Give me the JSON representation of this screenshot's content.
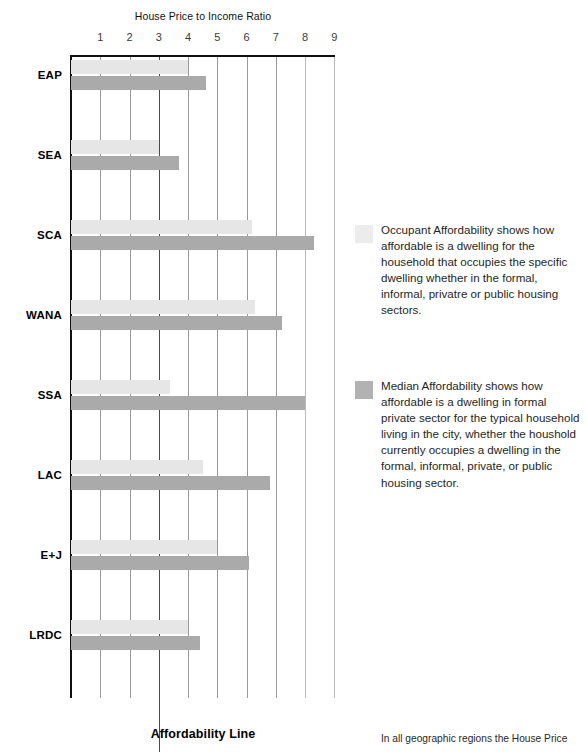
{
  "chart_data": {
    "type": "bar",
    "orientation": "horizontal",
    "title": "House Price to Income Ratio",
    "xlabel": "House Price to Income Ratio",
    "ylabel": "",
    "xlim": [
      0,
      9.6
    ],
    "xticks": [
      1,
      2,
      3,
      4,
      5,
      6,
      7,
      8,
      9
    ],
    "grid": true,
    "legend_position": "right",
    "categories": [
      "EAP",
      "SEA",
      "SCA",
      "WANA",
      "SSA",
      "LAC",
      "E+J",
      "LRDC"
    ],
    "series": [
      {
        "name": "Occupant Affordability",
        "color": "#e6e6e6",
        "values": [
          4.0,
          3.0,
          6.2,
          6.3,
          3.4,
          4.5,
          5.0,
          4.0
        ]
      },
      {
        "name": "Median Affordability",
        "color": "#aaaaaa",
        "values": [
          4.6,
          3.7,
          8.3,
          7.2,
          8.0,
          6.8,
          6.1,
          4.4
        ]
      }
    ],
    "annotations": [
      {
        "name": "affordability-line",
        "value": 3,
        "label": "Affordability Line",
        "color": "#4a4a4a"
      }
    ]
  },
  "axis": {
    "title": "House Price to Income Ratio",
    "ticks": [
      "1",
      "2",
      "3",
      "4",
      "5",
      "6",
      "7",
      "8",
      "9"
    ]
  },
  "categories": [
    "EAP",
    "SEA",
    "SCA",
    "WANA",
    "SSA",
    "LAC",
    "E+J",
    "LRDC"
  ],
  "affordability_line_label": "Affordability Line",
  "legend": {
    "items": [
      {
        "swatch": "occupant",
        "text": "Occupant Affordability shows how affordable is a dwelling for the household that occupies the specific dwelling whether in the formal, informal, privatre or public housing sectors."
      },
      {
        "swatch": "median",
        "text": "Median Affordability shows how affordable is a dwelling in formal private sector for the typical household living in the city, whether the houshold currently occupies a dwelling in the formal, informal, private, or public housing sector."
      }
    ]
  },
  "body_note": "In all geographic regions the House Price",
  "colors": {
    "occupant": "#e6e6e6",
    "median": "#aaaaaa",
    "axis": "#111111",
    "grid": "#9a9a9a",
    "affordability_line": "#4a4a4a"
  }
}
